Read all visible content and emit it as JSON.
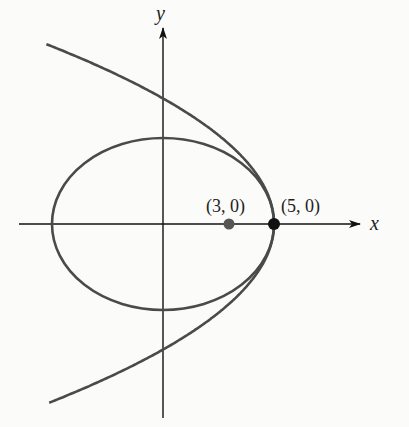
{
  "figure": {
    "type": "diagram",
    "axes": {
      "x_label": "x",
      "y_label": "y"
    },
    "points": [
      {
        "label": "(3, 0)",
        "x": 3,
        "y": 0,
        "color": "#555555"
      },
      {
        "label": "(5, 0)",
        "x": 5,
        "y": 0,
        "color": "#111111"
      }
    ],
    "curves": [
      {
        "name": "ellipse",
        "equation": "x^2/25 + y^2/16 = 1",
        "a": 5,
        "b": 4
      },
      {
        "name": "parabola",
        "equation": "x = 5 - (5/32) y^2",
        "vertex": [
          5,
          0
        ],
        "opens": "left"
      }
    ],
    "colors": {
      "curve": "#4a4a4a",
      "axis": "#111111",
      "background": "#fbfbf9"
    }
  },
  "chart_data": {
    "type": "diagram",
    "title": "",
    "xlabel": "x",
    "ylabel": "y",
    "annotations": [
      "(3, 0)",
      "(5, 0)"
    ],
    "series": [
      {
        "name": "ellipse",
        "equation": "x^2/25 + y^2/16 = 1"
      },
      {
        "name": "parabola",
        "equation": "y^2 = -6.4(x - 5)"
      }
    ],
    "xlim": [
      -6.3,
      7.5
    ],
    "ylim": [
      -8.7,
      10
    ],
    "grid": false
  }
}
